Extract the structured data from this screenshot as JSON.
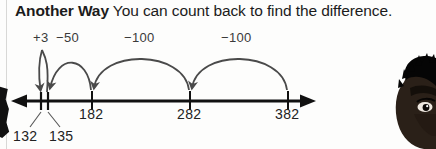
{
  "heading": {
    "lead": "Another Way",
    "rest": " You can count back to find the difference."
  },
  "number_line": {
    "start_label": "132",
    "ticks": [
      {
        "value": "132",
        "x": 41,
        "labeled_below": true
      },
      {
        "value": "135",
        "x": 47,
        "labeled_below": true
      },
      {
        "value": "182",
        "x": 92,
        "labeled_below": false
      },
      {
        "value": "282",
        "x": 190,
        "labeled_below": false
      },
      {
        "value": "382",
        "x": 288,
        "labeled_below": false
      }
    ],
    "tick_labels": [
      "182",
      "282",
      "382"
    ],
    "callout_labels": [
      "132",
      "135"
    ],
    "left_arrow": true,
    "right_arrow": true
  },
  "jumps": [
    {
      "label": "+3",
      "from": "135",
      "to": "132"
    },
    {
      "label": "−50",
      "from": "182",
      "to": "135"
    },
    {
      "label": "−100",
      "from": "282",
      "to": "182"
    },
    {
      "label": "−100",
      "from": "382",
      "to": "282"
    }
  ],
  "colors": {
    "page_background": "#fdfdfc",
    "text": "#1b1b1b",
    "line": "#111111",
    "arc": "#4a4a4a"
  },
  "photo": {
    "alt": "student-portrait"
  }
}
